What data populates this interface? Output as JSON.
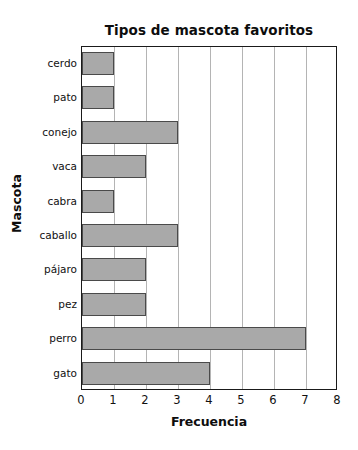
{
  "chart_data": {
    "type": "bar",
    "orientation": "horizontal",
    "title": "Tipos de mascota favoritos",
    "xlabel": "Frecuencia",
    "ylabel": "Mascota",
    "categories": [
      "cerdo",
      "pato",
      "conejo",
      "vaca",
      "cabra",
      "caballo",
      "pájaro",
      "pez",
      "perro",
      "gato"
    ],
    "values": [
      1,
      1,
      3,
      2,
      1,
      3,
      2,
      2,
      7,
      4
    ],
    "xlim": [
      0,
      8
    ],
    "xticks": [
      "0",
      "1",
      "2",
      "3",
      "4",
      "5",
      "6",
      "7",
      "8"
    ],
    "grid": "vertical",
    "legend": "none",
    "bar_color": "#a9a9a9",
    "bar_border_color": "#4a4a4a",
    "gridline_color": "#b4b4b4",
    "frame_color": "#1a1a1a",
    "background": "#ffffff"
  }
}
